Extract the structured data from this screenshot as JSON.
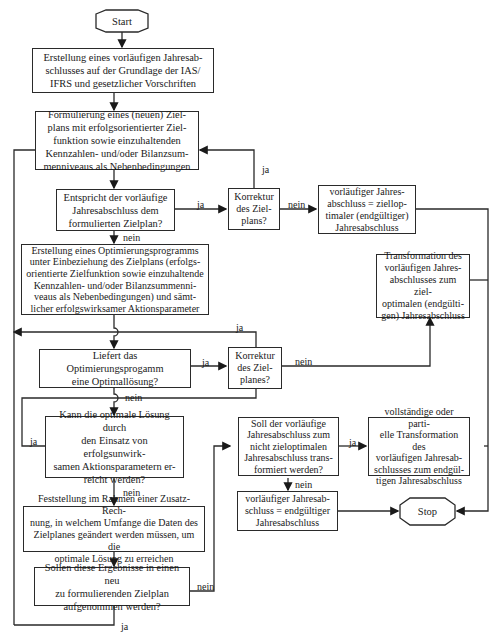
{
  "diagram": {
    "nodes": {
      "start": "Start",
      "create_prelim": "Erstellung eines vorläufigen Jahresab-\nschlusses auf der Grundlage der IAS/\nIFRS und gesetzlicher Vorschriften",
      "formulate_plan": "Formulierung eines (neuen) Ziel-\nplans mit erfolgsorientierter Ziel-\nfunktion sowie einzuhaltenden\nKennzahlen- und/oder Bilanzsum-\nmenniveaus als Nebenbedingungen",
      "matches_plan": "Entspricht der vorläufige\nJahresabschluss dem\nformulierten Zielplan?",
      "correct_plan_1": "Korrektur\ndes Ziel-\nplans?",
      "prelim_equals_optimal": "vorläufiger Jahres-\nabschluss = ziellop-\ntimaler (endgültiger)\nJahresabschluss",
      "create_optimization": "Erstellung eines Optimierungsprogramms\nunter Einbeziehung des Zielplans (erfolgs-\norientierte Zielfunktion sowie einzuhaltende\nKennzahlen- und/oder Bilanzsummenni-\nveaus als Nebenbedingungen) und sämt-\nlicher erfolgswirksamer Aktionsparameter",
      "transformation_optimal": "Transformation des\nvorläufigen Jahres-\nabschlusses zum ziel-\noptimalen (endgülti-\ngen) Jahresabschluss",
      "optimal_solution": "Liefert das Optimierungsprogamm\neine Optimallösung?",
      "correct_plan_2": "Korrektur\ndes Ziel-\nplanes?",
      "unaffected_params": "Kann die optimale Lösung durch\nden Einsatz von erfolgsunwirk-\nsamen Aktionsparametern er-\nreicht werden?",
      "additional_calc": "Feststellung im Rahmen einer Zusatz-Rech-\nnung, in  welchem Umfange die Daten  des\nZielplanes geändert werden müssen, um die\noptimale Lösung zu erreichen",
      "new_plan": "Sollen diese Ergebnisse in einen neu\nzu formulierenden Zielplan\naufgenommen werden?",
      "transform_nonoptimal": "Soll der vorläufige\nJahresabschluss zum\nnicht zieloptimalen\nJahresabschluss trans-\nformiert werden?",
      "partial_transform": "vollständige oder parti-\nelle Transformation des\nvorläufigen Jahresab-\nschlusses zum   endgül-\ntigen Jahresabschluss",
      "prelim_equals_final": "vorläufiger Jahresab-\nschluss = endgültiger\nJahresabschluss",
      "stop": "Stop"
    },
    "labels": {
      "yes": "ja",
      "no": "nein"
    }
  }
}
